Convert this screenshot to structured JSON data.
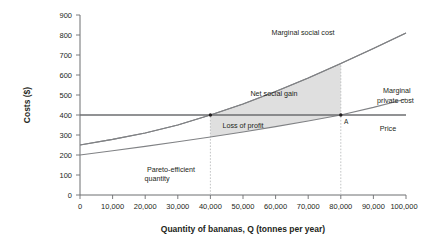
{
  "chart_data": {
    "type": "line",
    "title": "",
    "xlabel": "Quantity of bananas, Q (tonnes per year)",
    "ylabel": "Costs ($)",
    "xlim": [
      0,
      100000
    ],
    "ylim": [
      0,
      900
    ],
    "grid": false,
    "legend_position": "inline-labels",
    "x_ticks": [
      "0",
      "10,000",
      "20,000",
      "30,000",
      "40,000",
      "50,000",
      "60,000",
      "70,000",
      "80,000",
      "90,000",
      "100,000"
    ],
    "x_tick_values": [
      0,
      10000,
      20000,
      30000,
      40000,
      50000,
      60000,
      70000,
      80000,
      90000,
      100000
    ],
    "y_ticks": [
      "0",
      "100",
      "200",
      "300",
      "400",
      "500",
      "600",
      "700",
      "800",
      "900"
    ],
    "y_tick_values": [
      0,
      100,
      200,
      300,
      400,
      500,
      600,
      700,
      800,
      900
    ],
    "series": [
      {
        "name": "Marginal social cost",
        "label": "Marginal social cost",
        "color": "#808285",
        "x": [
          0,
          10000,
          20000,
          30000,
          40000,
          50000,
          60000,
          70000,
          80000,
          90000,
          100000
        ],
        "values": [
          250,
          278,
          310,
          350,
          400,
          455,
          517,
          585,
          658,
          733,
          810
        ]
      },
      {
        "name": "Marginal private cost",
        "label": "Marginal private cost",
        "color": "#808285",
        "x": [
          0,
          10000,
          20000,
          30000,
          40000,
          50000,
          60000,
          70000,
          80000,
          90000,
          100000
        ],
        "values": [
          200,
          221,
          243,
          266,
          290,
          315,
          342,
          370,
          400,
          438,
          480
        ]
      },
      {
        "name": "Price",
        "label": "Price",
        "color": "#6d6e71",
        "x": [
          0,
          100000
        ],
        "values": [
          400,
          400
        ]
      }
    ],
    "annotations": [
      {
        "name": "net-social-gain",
        "text": "Net social gain",
        "x": 57000,
        "y": 470
      },
      {
        "name": "loss-of-profit",
        "text": "Loss of profit",
        "x": 47500,
        "y": 372
      },
      {
        "name": "pareto-efficient-quantity",
        "text": "Pareto-efficient",
        "text2": "quantity",
        "x": 28000,
        "y": 120
      },
      {
        "name": "point-a",
        "text": "A",
        "x": 81000,
        "y": 383
      }
    ],
    "markers": [
      {
        "name": "pareto-efficient-point",
        "x": 40000,
        "y": 400
      },
      {
        "name": "market-equilibrium-point-a",
        "x": 80000,
        "y": 400
      }
    ],
    "vertical_guides": [
      {
        "name": "guide-40000",
        "x": 40000,
        "from": 0,
        "to": 400
      },
      {
        "name": "guide-80000",
        "x": 80000,
        "from": 0,
        "to": 658
      }
    ],
    "shaded_regions": [
      {
        "name": "net-social-gain-region",
        "label": "Net social gain",
        "x_from": 40000,
        "x_to": 80000,
        "upper": "Marginal social cost",
        "lower": "Price",
        "color": "#d9d9d9"
      },
      {
        "name": "loss-of-profit-region",
        "label": "Loss of profit",
        "x_from": 40000,
        "x_to": 80000,
        "upper": "Price",
        "lower": "Marginal private cost",
        "color": "#d9d9d9"
      }
    ]
  }
}
